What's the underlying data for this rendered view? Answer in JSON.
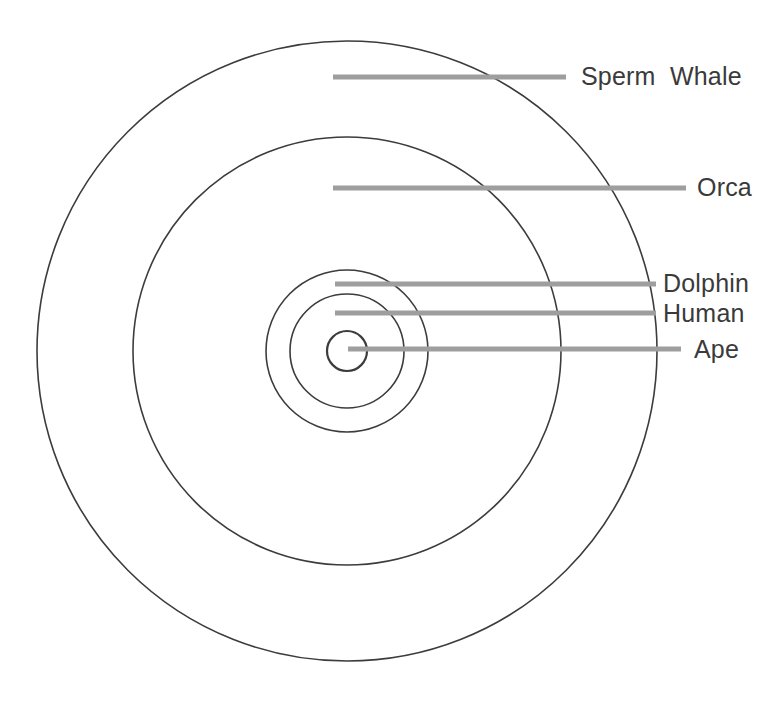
{
  "figure": {
    "type": "concentric-circle-diagram",
    "background_color": "#ffffff",
    "circle_stroke_color": "#3c3c3c",
    "leader_line_color": "#9e9e9e",
    "label_color": "#3a3a3a",
    "center": {
      "x": 347,
      "y": 351
    },
    "items": [
      {
        "label": "Sperm  Whale",
        "radius": 310,
        "leader": {
          "x1": 333,
          "y1": 77,
          "x2": 566,
          "y2": 77
        },
        "label_pos": {
          "x": 581,
          "y": 64
        }
      },
      {
        "label": "Orca",
        "radius": 214,
        "leader": {
          "x1": 333,
          "y1": 188,
          "x2": 686,
          "y2": 188
        },
        "label_pos": {
          "x": 697,
          "y": 175
        }
      },
      {
        "label": "Dolphin",
        "radius": 81,
        "leader": {
          "x1": 335,
          "y1": 284,
          "x2": 656,
          "y2": 284
        },
        "label_pos": {
          "x": 663,
          "y": 271
        }
      },
      {
        "label": "Human",
        "radius": 57,
        "leader": {
          "x1": 335,
          "y1": 313,
          "x2": 656,
          "y2": 313
        },
        "label_pos": {
          "x": 663,
          "y": 301
        }
      },
      {
        "label": "Ape",
        "radius": 20,
        "leader": {
          "x1": 348,
          "y1": 349,
          "x2": 681,
          "y2": 349
        },
        "label_pos": {
          "x": 694,
          "y": 337
        }
      }
    ]
  }
}
